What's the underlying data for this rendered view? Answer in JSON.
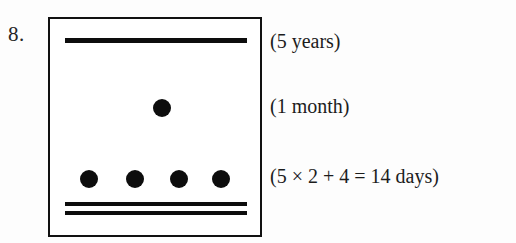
{
  "item": {
    "number_label": "8."
  },
  "glyph_box": {
    "marks": [
      {
        "kind": "rule",
        "name": "year-rule",
        "count": 1,
        "meaning": "years"
      },
      {
        "kind": "dot",
        "name": "month-dot",
        "count": 1,
        "meaning": "months"
      },
      {
        "kind": "dot",
        "name": "unit-dot-row",
        "count": 4,
        "meaning": "days-units"
      },
      {
        "kind": "rule",
        "name": "day-rule-double",
        "count": 2,
        "meaning": "days-fives"
      }
    ]
  },
  "annotations": {
    "years": "(5 years)",
    "month": "(1 month)",
    "days": "(5 × 2 + 4 = 14 days)"
  },
  "colors": {
    "ink": "#0d0d0d",
    "border": "#111111",
    "page_background": "#fdfdfd",
    "box_background": "#ffffff"
  }
}
